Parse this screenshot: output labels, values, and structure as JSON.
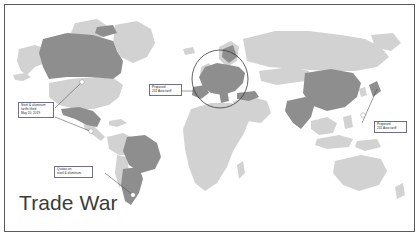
{
  "figure": {
    "title": "Trade War",
    "type": "annotated-world-map"
  },
  "map": {
    "base_color": "#d2d2d2",
    "highlight_color": "#8e8e8e",
    "ocean_color": "#ffffff",
    "border_color": "#5a5a5a",
    "marker_color": "#ffffff",
    "highlighted_regions": [
      "Canada",
      "Mexico",
      "Brazil",
      "Argentina",
      "European Union",
      "Turkey",
      "China",
      "India",
      "Japan"
    ],
    "base_regions": [
      "United States",
      "Alaska",
      "Greenland",
      "Russia",
      "Africa",
      "Australia",
      "Southeast Asia",
      "Middle East",
      "Scandinavia"
    ]
  },
  "annotations": [
    {
      "id": "north-america",
      "lines": [
        "Steel & aluminum",
        "tariffs lifted",
        "May 20, 2019"
      ],
      "targets": [
        "Canada",
        "Mexico"
      ]
    },
    {
      "id": "european-union",
      "lines": [
        "Proposed",
        "232 Auto tariff"
      ],
      "targets": [
        "European Union"
      ]
    },
    {
      "id": "japan",
      "lines": [
        "Proposed",
        "232 Auto tariff"
      ],
      "targets": [
        "Japan"
      ]
    },
    {
      "id": "south-america",
      "lines": [
        "Quotas on",
        "steel & aluminum"
      ],
      "targets": [
        "Brazil",
        "Argentina"
      ]
    }
  ]
}
